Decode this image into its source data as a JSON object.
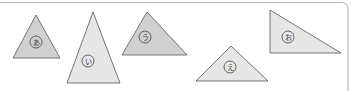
{
  "colors": {
    "frame": "#b8b8b8",
    "fill_gray": "#d0d0d0",
    "fill_light": "#e6e6e6",
    "stroke": "#666666",
    "label_circle": "#444444"
  },
  "triangles": [
    {
      "id": "a",
      "label": "あ",
      "points": "36,15 13,58 60,58",
      "label_pos": [
        36,
        42
      ],
      "fill": "gray"
    },
    {
      "id": "i",
      "label": "い",
      "points": "93,12 67,83 120,83",
      "label_pos": [
        88,
        61
      ],
      "fill": "light"
    },
    {
      "id": "u",
      "label": "う",
      "points": "147,12 122,55 187,55",
      "label_pos": [
        145,
        37
      ],
      "fill": "gray"
    },
    {
      "id": "e",
      "label": "え",
      "points": "231,46 196,81 268,81",
      "label_pos": [
        230,
        67
      ],
      "fill": "light"
    },
    {
      "id": "o",
      "label": "お",
      "points": "270,10 270,53 341,53",
      "label_pos": [
        288,
        37
      ],
      "fill": "light"
    }
  ]
}
